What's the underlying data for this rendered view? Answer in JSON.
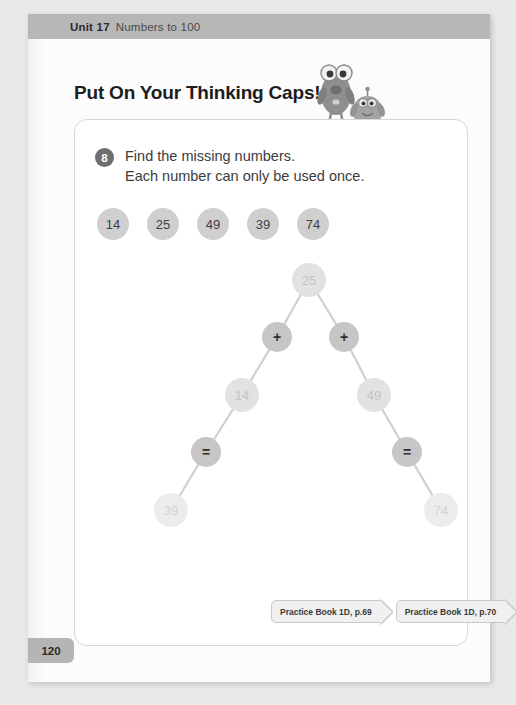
{
  "header": {
    "unit_label": "Unit 17",
    "unit_title": "Numbers to 100"
  },
  "heading": "Put On Your Thinking Caps!",
  "exercise": {
    "number": "8",
    "instruction_line1": "Find the missing numbers.",
    "instruction_line2": "Each number can only be used once."
  },
  "number_chips": [
    {
      "value": "14"
    },
    {
      "value": "25"
    },
    {
      "value": "49"
    },
    {
      "value": "39"
    },
    {
      "value": "74"
    }
  ],
  "tree": {
    "nodes": [
      {
        "id": "n-25",
        "label": "25",
        "kind": "value",
        "faint": false,
        "x": 234,
        "y": 160
      },
      {
        "id": "n-plus-left",
        "label": "+",
        "kind": "op",
        "faint": false,
        "x": 202,
        "y": 217
      },
      {
        "id": "n-plus-right",
        "label": "+",
        "kind": "op",
        "faint": false,
        "x": 269,
        "y": 217
      },
      {
        "id": "n-14",
        "label": "14",
        "kind": "value",
        "faint": false,
        "x": 167,
        "y": 275
      },
      {
        "id": "n-49",
        "label": "49",
        "kind": "value",
        "faint": false,
        "x": 299,
        "y": 275
      },
      {
        "id": "n-eq-left",
        "label": "=",
        "kind": "op",
        "faint": false,
        "x": 131,
        "y": 332
      },
      {
        "id": "n-eq-right",
        "label": "=",
        "kind": "op",
        "faint": false,
        "x": 332,
        "y": 332
      },
      {
        "id": "n-39",
        "label": "39",
        "kind": "value",
        "faint": true,
        "x": 96,
        "y": 390
      },
      {
        "id": "n-74",
        "label": "74",
        "kind": "value",
        "faint": true,
        "x": 366,
        "y": 390
      }
    ],
    "edges": [
      {
        "from": "n-25",
        "to": "n-plus-left"
      },
      {
        "from": "n-25",
        "to": "n-plus-right"
      },
      {
        "from": "n-plus-left",
        "to": "n-14"
      },
      {
        "from": "n-plus-right",
        "to": "n-49"
      },
      {
        "from": "n-14",
        "to": "n-eq-left"
      },
      {
        "from": "n-49",
        "to": "n-eq-right"
      },
      {
        "from": "n-eq-left",
        "to": "n-39"
      },
      {
        "from": "n-eq-right",
        "to": "n-74"
      }
    ],
    "edge_color": "#cfcfcf"
  },
  "practice_tags": [
    {
      "label": "Practice Book 1D, p.69"
    },
    {
      "label": "Practice Book 1D, p.70"
    }
  ],
  "page_number": "120",
  "colors": {
    "unit_bar": "#b7b7b7",
    "chip_fill": "#cfcfcf",
    "node_value_fill": "#e2e2e2",
    "node_value_faint_fill": "#ececec",
    "node_op_fill": "#c6c6c6",
    "badge_fill": "#6e6e6e"
  }
}
